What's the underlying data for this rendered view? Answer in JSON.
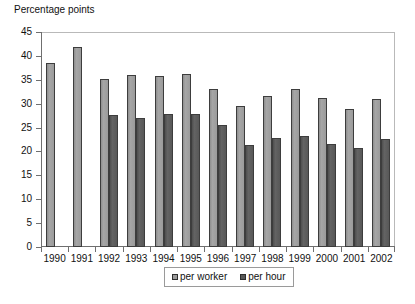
{
  "chart_data": {
    "type": "bar",
    "title": "Percentage points",
    "xlabel": "",
    "ylabel": "Percentage points",
    "ylim": [
      0,
      45
    ],
    "ytick_step": 5,
    "yticks": [
      0,
      5,
      10,
      15,
      20,
      25,
      30,
      35,
      40,
      45
    ],
    "grid": false,
    "legend_position": "bottom-center",
    "categories": [
      "1990",
      "1991",
      "1992",
      "1993",
      "1994",
      "1995",
      "1996",
      "1997",
      "1998",
      "1999",
      "2000",
      "2001",
      "2002"
    ],
    "series": [
      {
        "name": "per worker",
        "color": "#9b9b9b",
        "values": [
          38.5,
          41.8,
          35.2,
          36.0,
          35.7,
          36.2,
          33.0,
          29.5,
          31.6,
          33.0,
          31.2,
          28.9,
          30.9
        ]
      },
      {
        "name": "per hour",
        "color": "#585858",
        "values": [
          null,
          null,
          27.6,
          27.0,
          27.8,
          27.8,
          25.5,
          21.3,
          22.8,
          23.2,
          21.6,
          20.8,
          22.6
        ]
      }
    ]
  },
  "legend": {
    "items": [
      {
        "label": "per worker"
      },
      {
        "label": "per hour"
      }
    ]
  }
}
